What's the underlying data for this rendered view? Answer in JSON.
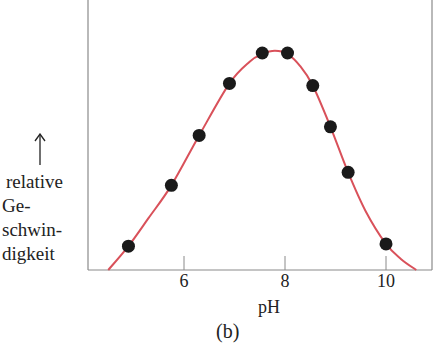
{
  "chart_data": {
    "type": "scatter",
    "title": "",
    "caption": "(b)",
    "xlabel": "pH",
    "ylabel_lines": [
      "relative",
      "Ge-",
      "schwin-",
      "digkeit"
    ],
    "ylabel": "relative Geschwindigkeit",
    "y_arrow": "↑",
    "x_ticks": [
      6,
      8,
      10
    ],
    "xlim": [
      4.1,
      10.9
    ],
    "ylim": [
      0,
      1.23
    ],
    "y_ticks": [],
    "grid": false,
    "legend": null,
    "series": [
      {
        "name": "Messpunkte",
        "type": "scatter",
        "color": "#1a1a1a",
        "x": [
          4.9,
          5.75,
          6.3,
          6.9,
          7.55,
          8.05,
          8.55,
          8.9,
          9.25,
          10.0
        ],
        "y": [
          0.11,
          0.39,
          0.62,
          0.86,
          1.0,
          1.0,
          0.85,
          0.66,
          0.45,
          0.12
        ]
      },
      {
        "name": "Kurve",
        "type": "line",
        "color": "#d9515a",
        "x": [
          4.5,
          4.9,
          5.3,
          5.75,
          6.3,
          6.9,
          7.3,
          7.55,
          7.8,
          8.05,
          8.3,
          8.55,
          8.9,
          9.25,
          9.6,
          10.0,
          10.3,
          10.6
        ],
        "y": [
          0.0,
          0.11,
          0.24,
          0.39,
          0.62,
          0.86,
          0.96,
          0.995,
          1.01,
          0.995,
          0.94,
          0.85,
          0.66,
          0.45,
          0.27,
          0.12,
          0.05,
          0.0
        ]
      }
    ]
  },
  "colors": {
    "axis": "#8a8a8a",
    "curve": "#d9515a",
    "marker": "#1a1a1a"
  }
}
